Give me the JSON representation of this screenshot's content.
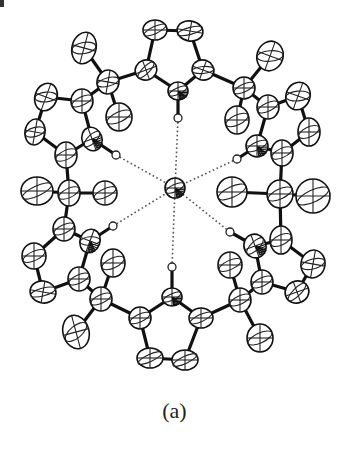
{
  "figure": {
    "caption": "(a)",
    "center": {
      "x": 175,
      "y": 188,
      "rx": 10,
      "ry": 10
    },
    "atoms": [
      {
        "id": "c1",
        "x": 155,
        "y": 30,
        "rx": 12,
        "ry": 10,
        "rot": 0
      },
      {
        "id": "c2",
        "x": 190,
        "y": 31,
        "rx": 13,
        "ry": 10,
        "rot": 10
      },
      {
        "id": "c3",
        "x": 146,
        "y": 70,
        "rx": 11,
        "ry": 10,
        "rot": -20
      },
      {
        "id": "c4",
        "x": 203,
        "y": 70,
        "rx": 11,
        "ry": 10,
        "rot": 20
      },
      {
        "id": "n1",
        "x": 178,
        "y": 91,
        "rx": 10,
        "ry": 9,
        "rot": 0,
        "hatched": true
      },
      {
        "id": "h1",
        "x": 178,
        "y": 118,
        "r": 4,
        "type": "H"
      },
      {
        "id": "q1",
        "x": 108,
        "y": 82,
        "rx": 11,
        "ry": 12,
        "rot": 10
      },
      {
        "id": "m1a",
        "x": 84,
        "y": 48,
        "rx": 12,
        "ry": 16,
        "rot": 15
      },
      {
        "id": "m1b",
        "x": 119,
        "y": 117,
        "rx": 13,
        "ry": 14,
        "rot": 0
      },
      {
        "id": "q2",
        "x": 244,
        "y": 88,
        "rx": 11,
        "ry": 11,
        "rot": 0
      },
      {
        "id": "m2a",
        "x": 270,
        "y": 56,
        "rx": 13,
        "ry": 15,
        "rot": 20
      },
      {
        "id": "m2b",
        "x": 237,
        "y": 120,
        "rx": 12,
        "ry": 14,
        "rot": 0
      },
      {
        "id": "l1",
        "x": 82,
        "y": 101,
        "rx": 11,
        "ry": 12,
        "rot": 0
      },
      {
        "id": "l2",
        "x": 46,
        "y": 97,
        "rx": 11,
        "ry": 14,
        "rot": 20
      },
      {
        "id": "l3",
        "x": 35,
        "y": 132,
        "rx": 10,
        "ry": 13,
        "rot": 10
      },
      {
        "id": "l4",
        "x": 66,
        "y": 155,
        "rx": 11,
        "ry": 13,
        "rot": 0
      },
      {
        "id": "nl1",
        "x": 92,
        "y": 139,
        "rx": 10,
        "ry": 12,
        "rot": -20,
        "hatched": true
      },
      {
        "id": "hl1",
        "x": 116,
        "y": 155,
        "r": 4,
        "type": "H"
      },
      {
        "id": "r1",
        "x": 268,
        "y": 107,
        "rx": 11,
        "ry": 12,
        "rot": 0
      },
      {
        "id": "r2",
        "x": 298,
        "y": 96,
        "rx": 12,
        "ry": 14,
        "rot": 20
      },
      {
        "id": "r3",
        "x": 309,
        "y": 132,
        "rx": 11,
        "ry": 14,
        "rot": 0
      },
      {
        "id": "r4",
        "x": 282,
        "y": 153,
        "rx": 11,
        "ry": 13,
        "rot": 0
      },
      {
        "id": "nr1",
        "x": 257,
        "y": 146,
        "rx": 11,
        "ry": 11,
        "rot": 0,
        "hatched": true
      },
      {
        "id": "hr1",
        "x": 237,
        "y": 159,
        "r": 4,
        "type": "H"
      },
      {
        "id": "ql",
        "x": 69,
        "y": 193,
        "rx": 11,
        "ry": 13,
        "rot": 0
      },
      {
        "id": "mla",
        "x": 37,
        "y": 191,
        "rx": 16,
        "ry": 14,
        "rot": 0
      },
      {
        "id": "mlb",
        "x": 105,
        "y": 193,
        "rx": 12,
        "ry": 12,
        "rot": 0
      },
      {
        "id": "qr",
        "x": 280,
        "y": 194,
        "rx": 13,
        "ry": 14,
        "rot": 0
      },
      {
        "id": "mra",
        "x": 232,
        "y": 192,
        "rx": 15,
        "ry": 15,
        "rot": 0
      },
      {
        "id": "mrb",
        "x": 313,
        "y": 196,
        "rx": 17,
        "ry": 17,
        "rot": 0
      },
      {
        "id": "lb1",
        "x": 64,
        "y": 229,
        "rx": 11,
        "ry": 12,
        "rot": 0
      },
      {
        "id": "nl2",
        "x": 90,
        "y": 241,
        "rx": 10,
        "ry": 12,
        "rot": 20,
        "hatched": true
      },
      {
        "id": "hl2",
        "x": 113,
        "y": 226,
        "r": 4,
        "type": "H"
      },
      {
        "id": "lb2",
        "x": 34,
        "y": 256,
        "rx": 12,
        "ry": 13,
        "rot": 0
      },
      {
        "id": "lb3",
        "x": 43,
        "y": 292,
        "rx": 13,
        "ry": 11,
        "rot": 10
      },
      {
        "id": "lb4",
        "x": 79,
        "y": 279,
        "rx": 11,
        "ry": 12,
        "rot": 0
      },
      {
        "id": "rb1",
        "x": 281,
        "y": 240,
        "rx": 11,
        "ry": 14,
        "rot": 0
      },
      {
        "id": "nr2",
        "x": 255,
        "y": 246,
        "rx": 11,
        "ry": 12,
        "rot": -20,
        "hatched": true
      },
      {
        "id": "hr2",
        "x": 230,
        "y": 232,
        "r": 4,
        "type": "H"
      },
      {
        "id": "rb2",
        "x": 313,
        "y": 264,
        "rx": 12,
        "ry": 14,
        "rot": 10
      },
      {
        "id": "rb3",
        "x": 297,
        "y": 292,
        "rx": 12,
        "ry": 11,
        "rot": -20
      },
      {
        "id": "rb4",
        "x": 262,
        "y": 282,
        "rx": 11,
        "ry": 12,
        "rot": 0
      },
      {
        "id": "qbl",
        "x": 101,
        "y": 299,
        "rx": 11,
        "ry": 12,
        "rot": 0
      },
      {
        "id": "mbla",
        "x": 113,
        "y": 263,
        "rx": 12,
        "ry": 14,
        "rot": 0
      },
      {
        "id": "mblb",
        "x": 76,
        "y": 332,
        "rx": 13,
        "ry": 17,
        "rot": -15
      },
      {
        "id": "qbr",
        "x": 240,
        "y": 300,
        "rx": 11,
        "ry": 12,
        "rot": 0
      },
      {
        "id": "mbra",
        "x": 230,
        "y": 265,
        "rx": 12,
        "ry": 13,
        "rot": 0
      },
      {
        "id": "mbrb",
        "x": 260,
        "y": 338,
        "rx": 13,
        "ry": 14,
        "rot": 0
      },
      {
        "id": "nb",
        "x": 172,
        "y": 297,
        "rx": 10,
        "ry": 9,
        "rot": 0,
        "hatched": true
      },
      {
        "id": "hb",
        "x": 172,
        "y": 267,
        "r": 4,
        "type": "H"
      },
      {
        "id": "b1",
        "x": 140,
        "y": 318,
        "rx": 11,
        "ry": 11,
        "rot": 0
      },
      {
        "id": "b2",
        "x": 201,
        "y": 318,
        "rx": 12,
        "ry": 10,
        "rot": 0
      },
      {
        "id": "b3",
        "x": 150,
        "y": 358,
        "rx": 13,
        "ry": 10,
        "rot": 0
      },
      {
        "id": "b4",
        "x": 185,
        "y": 360,
        "rx": 13,
        "ry": 10,
        "rot": 0
      }
    ],
    "bonds": [
      [
        "c1",
        "c2"
      ],
      [
        "c1",
        "c3"
      ],
      [
        "c2",
        "c4"
      ],
      [
        "c3",
        "n1"
      ],
      [
        "c4",
        "n1"
      ],
      [
        "n1",
        "h1"
      ],
      [
        "c3",
        "q1"
      ],
      [
        "q1",
        "m1a"
      ],
      [
        "q1",
        "m1b"
      ],
      [
        "q1",
        "l1"
      ],
      [
        "c4",
        "q2"
      ],
      [
        "q2",
        "m2a"
      ],
      [
        "q2",
        "m2b"
      ],
      [
        "q2",
        "r1"
      ],
      [
        "l1",
        "l2"
      ],
      [
        "l2",
        "l3"
      ],
      [
        "l3",
        "l4"
      ],
      [
        "l4",
        "nl1"
      ],
      [
        "nl1",
        "l1"
      ],
      [
        "nl1",
        "hl1"
      ],
      [
        "r1",
        "r2"
      ],
      [
        "r2",
        "r3"
      ],
      [
        "r3",
        "r4"
      ],
      [
        "r4",
        "nr1"
      ],
      [
        "nr1",
        "r1"
      ],
      [
        "nr1",
        "hr1"
      ],
      [
        "l4",
        "ql"
      ],
      [
        "ql",
        "mla"
      ],
      [
        "ql",
        "mlb"
      ],
      [
        "ql",
        "lb1"
      ],
      [
        "r4",
        "qr"
      ],
      [
        "qr",
        "mra"
      ],
      [
        "qr",
        "mrb"
      ],
      [
        "qr",
        "rb1"
      ],
      [
        "lb1",
        "nl2"
      ],
      [
        "lb1",
        "lb2"
      ],
      [
        "lb2",
        "lb3"
      ],
      [
        "lb3",
        "lb4"
      ],
      [
        "lb4",
        "nl2"
      ],
      [
        "nl2",
        "hl2"
      ],
      [
        "rb1",
        "nr2"
      ],
      [
        "rb1",
        "rb2"
      ],
      [
        "rb2",
        "rb3"
      ],
      [
        "rb3",
        "rb4"
      ],
      [
        "rb4",
        "nr2"
      ],
      [
        "nr2",
        "hr2"
      ],
      [
        "lb4",
        "qbl"
      ],
      [
        "qbl",
        "mbla"
      ],
      [
        "qbl",
        "mblb"
      ],
      [
        "qbl",
        "b1"
      ],
      [
        "rb4",
        "qbr"
      ],
      [
        "qbr",
        "mbra"
      ],
      [
        "qbr",
        "mbrb"
      ],
      [
        "qbr",
        "b2"
      ],
      [
        "nb",
        "b1"
      ],
      [
        "nb",
        "b2"
      ],
      [
        "b1",
        "b3"
      ],
      [
        "b2",
        "b4"
      ],
      [
        "b3",
        "b4"
      ],
      [
        "nb",
        "hb"
      ]
    ],
    "hbonds": [
      "h1",
      "hl1",
      "hr1",
      "hl2",
      "hr2",
      "hb"
    ]
  }
}
